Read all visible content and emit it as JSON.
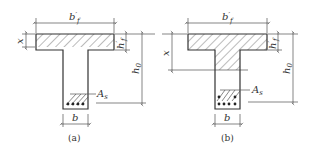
{
  "figure": {
    "panels": [
      {
        "id": "a",
        "caption": "(a)",
        "labels": {
          "flange_width": "b'f",
          "flange_width_main": "b",
          "flange_width_sub": "f",
          "flange_width_prime": "′",
          "flange_thickness_main": "h",
          "flange_thickness_sub": "f",
          "flange_thickness_prime": "′",
          "compression_depth": "x",
          "effective_depth_main": "h",
          "effective_depth_sub": "0",
          "steel_area_main": "A",
          "steel_area_sub": "s",
          "web_width": "b"
        },
        "description": "Neutral axis within flange (x ≤ h'f)"
      },
      {
        "id": "b",
        "caption": "(b)",
        "labels": {
          "flange_width_main": "b",
          "flange_width_sub": "f",
          "flange_width_prime": "′",
          "flange_thickness_main": "h",
          "flange_thickness_sub": "f",
          "flange_thickness_prime": "′",
          "compression_depth": "x",
          "effective_depth_main": "h",
          "effective_depth_sub": "0",
          "steel_area_main": "A",
          "steel_area_sub": "s",
          "web_width": "b"
        },
        "description": "Neutral axis within web (x > h'f)"
      }
    ],
    "colors": {
      "line": "#333333",
      "hatch": "#555555",
      "background": "#ffffff"
    }
  }
}
